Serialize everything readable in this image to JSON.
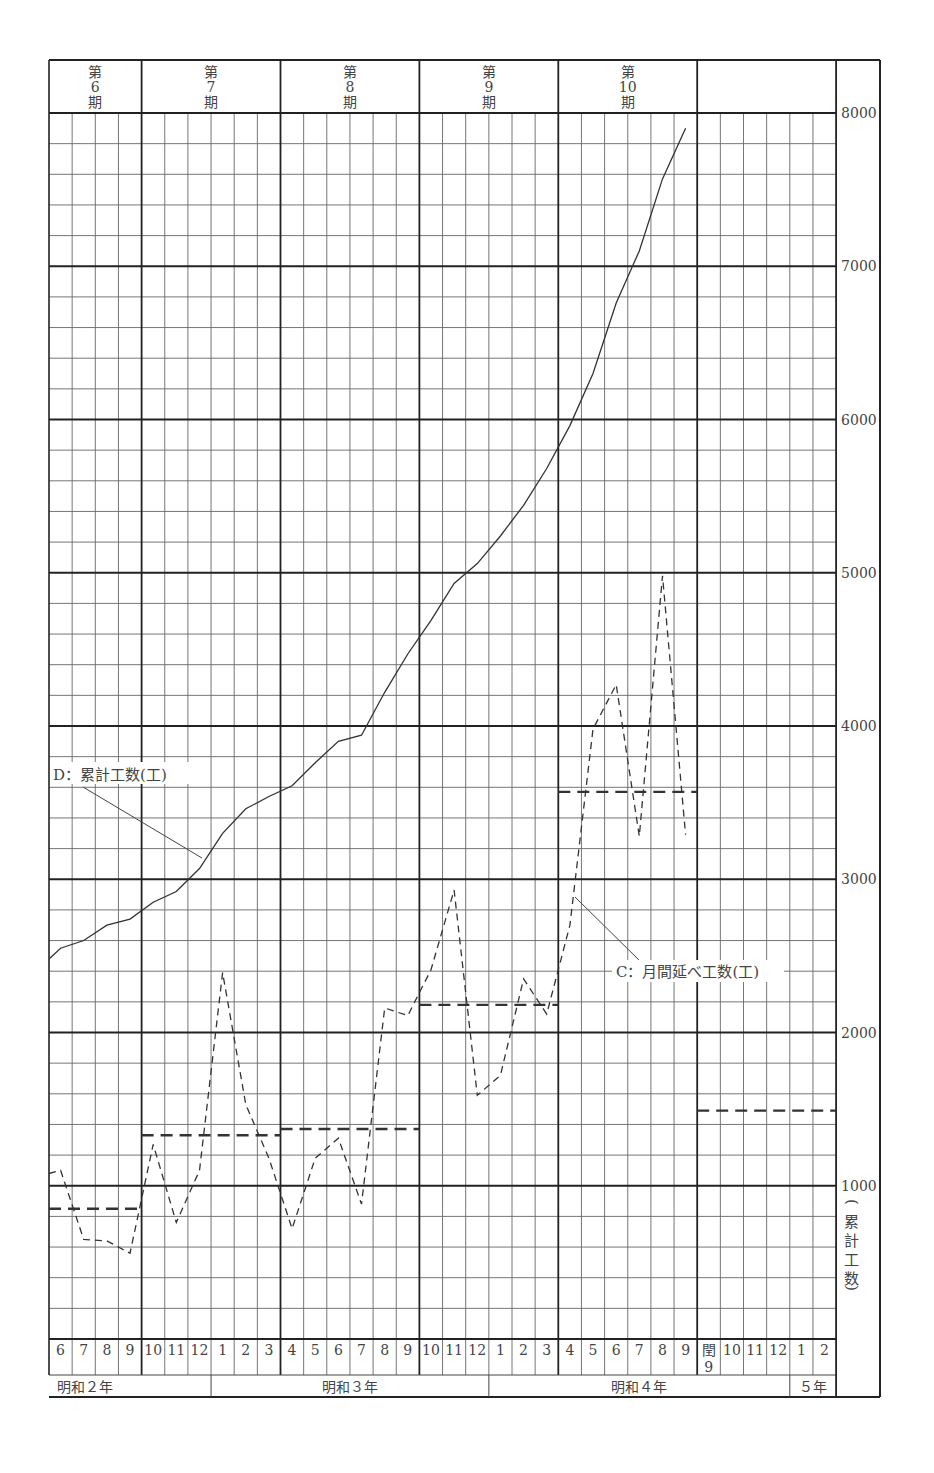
{
  "chart_data": {
    "type": "line",
    "title": "",
    "ylabel": "(累計工数)",
    "ylim": [
      0,
      8000
    ],
    "y_ticks": [
      1000,
      2000,
      3000,
      4000,
      5000,
      6000,
      7000,
      8000
    ],
    "y_minor_step": 200,
    "grid": true,
    "periods": [
      {
        "label": "第\n6\n期",
        "months": 4
      },
      {
        "label": "第\n7\n期",
        "months": 6
      },
      {
        "label": "第\n8\n期",
        "months": 6
      },
      {
        "label": "第\n9\n期",
        "months": 6
      },
      {
        "label": "第\n10\n期",
        "months": 6
      },
      {
        "label": "",
        "months": 6
      }
    ],
    "categories": [
      "6",
      "7",
      "8",
      "9",
      "10",
      "11",
      "12",
      "1",
      "2",
      "3",
      "4",
      "5",
      "6",
      "7",
      "8",
      "9",
      "10",
      "11",
      "12",
      "1",
      "2",
      "3",
      "4",
      "5",
      "6",
      "7",
      "8",
      "9",
      "閏\n9",
      "10",
      "11",
      "12",
      "1",
      "2"
    ],
    "years": [
      {
        "label": "明和２年",
        "span": 7
      },
      {
        "label": "明和３年",
        "span": 12
      },
      {
        "label": "明和４年",
        "span": 13
      },
      {
        "label": "５年",
        "span": 2
      }
    ],
    "series": [
      {
        "name": "D：累計工数(工)",
        "style": "solid",
        "values": [
          2550,
          2600,
          2700,
          2740,
          2850,
          2920,
          3070,
          3300,
          3460,
          3540,
          3610,
          3760,
          3900,
          3940,
          4220,
          4470,
          4690,
          4930,
          5060,
          5240,
          5440,
          5680,
          5960,
          6300,
          6760,
          7100,
          7570,
          7900,
          null,
          null,
          null,
          null,
          null,
          null
        ]
      },
      {
        "name": "C：月間延べ工数(工)",
        "style": "dashed",
        "values": [
          1100,
          650,
          640,
          560,
          1270,
          760,
          1100,
          2390,
          1530,
          1180,
          720,
          1180,
          1310,
          880,
          2160,
          2110,
          2410,
          2930,
          1590,
          1720,
          2350,
          2120,
          2700,
          3980,
          4270,
          3280,
          4980,
          3290,
          null,
          null,
          null,
          null,
          null,
          null
        ]
      },
      {
        "name": "period average (C)",
        "style": "bold-dashed",
        "segments": [
          {
            "period": "第6期",
            "value": 850
          },
          {
            "period": "第7期",
            "value": 1330
          },
          {
            "period": "第8期",
            "value": 1370
          },
          {
            "period": "第9期",
            "value": 2180
          },
          {
            "period": "第10期",
            "value": 3570
          },
          {
            "period": "(next)",
            "value": 1490
          }
        ]
      }
    ],
    "annotations": [
      {
        "text": "D：累計工数(工)",
        "target": "cumulative line"
      },
      {
        "text": "C：月間延べ工数(工)",
        "target": "monthly line"
      }
    ]
  },
  "labels": {
    "period_1": [
      "第",
      "6",
      "期"
    ],
    "period_2": [
      "第",
      "7",
      "期"
    ],
    "period_3": [
      "第",
      "8",
      "期"
    ],
    "period_4": [
      "第",
      "9",
      "期"
    ],
    "period_5": [
      "第",
      "10",
      "期"
    ],
    "y_axis_title": [
      "(",
      "累",
      "計",
      "工",
      "数",
      ")"
    ],
    "annot_d": "D：累計工数(工)",
    "annot_c": "C：月間延べ工数(工)",
    "year_2": "明和２年",
    "year_3": "明和３年",
    "year_4": "明和４年",
    "year_5": "５年"
  }
}
